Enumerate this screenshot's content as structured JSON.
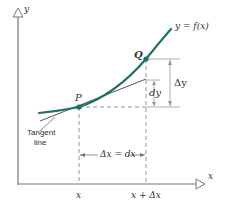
{
  "diagram": {
    "colors": {
      "curve": "#1f6f6b",
      "point": "#1f6f6b",
      "axis": "#777777",
      "tangent": "#555555",
      "dashed": "#888888",
      "text": "#333333"
    },
    "axes": {
      "y_label": "y",
      "x_label": "x"
    },
    "curve_label": "y = f(x)",
    "points": {
      "P": {
        "label": "P"
      },
      "Q": {
        "label": "Q"
      }
    },
    "tangent_label_line1": "Tangent",
    "tangent_label_line2": "line",
    "increments": {
      "delta_y": "Δy",
      "dy": "dy",
      "delta_x_eq_dx": "Δx = dx"
    },
    "x_ticks": {
      "left": "x",
      "right": "x + Δx"
    }
  }
}
